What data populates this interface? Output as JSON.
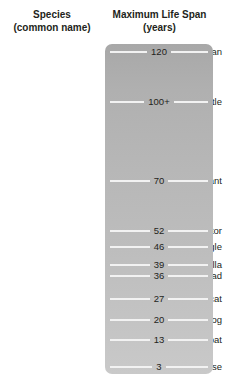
{
  "header": {
    "species_line1": "Species",
    "species_line2": "(common name)",
    "lifespan_line1": "Maximum Life Span",
    "lifespan_line2": "(years)"
  },
  "colors": {
    "bar_top": "#a8a8a8",
    "bar_bottom": "#c9c9c9",
    "tick_line": "#f2f2f2",
    "text": "#231f20",
    "background": "#ffffff"
  },
  "rows": [
    {
      "species": "Human",
      "value": "120",
      "value_num": 120,
      "y": 51
    },
    {
      "species": "Galápagos turtle",
      "value": "100+",
      "value_num": 100,
      "y": 101
    },
    {
      "species": "Indian elephant",
      "value": "70",
      "value_num": 70,
      "y": 180
    },
    {
      "species": "Chinese alligator",
      "value": "52",
      "value_num": 52,
      "y": 230
    },
    {
      "species": "Golden eagle",
      "value": "46",
      "value_num": 46,
      "y": 246
    },
    {
      "species": "Gorilla",
      "value": "39",
      "value_num": 39,
      "y": 264
    },
    {
      "species": "Common toad",
      "value": "36",
      "value_num": 36,
      "y": 275
    },
    {
      "species": "Domestic cat",
      "value": "27",
      "value_num": 27,
      "y": 298
    },
    {
      "species": "Domestic dog",
      "value": "20",
      "value_num": 20,
      "y": 319
    },
    {
      "species": "Vampire bat",
      "value": "13",
      "value_num": 13,
      "y": 339
    },
    {
      "species": "House mouse",
      "value": "3",
      "value_num": 3,
      "y": 366
    }
  ],
  "chart_data": {
    "type": "bar",
    "title": "Maximum Life Span (years)",
    "xlabel": "Maximum Life Span (years)",
    "ylabel": "Species (common name)",
    "orientation": "horizontal-scale",
    "grid": false,
    "legend": null,
    "categories": [
      "Human",
      "Galápagos turtle",
      "Indian elephant",
      "Chinese alligator",
      "Golden eagle",
      "Gorilla",
      "Common toad",
      "Domestic cat",
      "Domestic dog",
      "Vampire bat",
      "House mouse"
    ],
    "values": [
      120,
      100,
      70,
      52,
      46,
      39,
      36,
      27,
      20,
      13,
      3
    ],
    "value_labels": [
      "120",
      "100+",
      "70",
      "52",
      "46",
      "39",
      "36",
      "27",
      "20",
      "13",
      "3"
    ],
    "ylim": [
      0,
      120
    ]
  }
}
